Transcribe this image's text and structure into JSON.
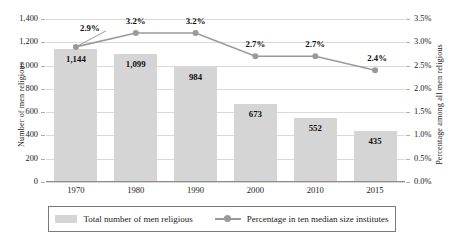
{
  "chart_data": {
    "type": "bar",
    "title": "",
    "subtitle": "",
    "categories": [
      "1970",
      "1980",
      "1990",
      "2000",
      "2010",
      "2015"
    ],
    "series": [
      {
        "name": "Total number of men religious",
        "type": "bar",
        "axis": "left",
        "values": [
          1144,
          1099,
          984,
          673,
          552,
          435
        ],
        "labels": [
          "1,144",
          "1,099",
          "984",
          "673",
          "552",
          "435"
        ],
        "color": "#d5d5d5"
      },
      {
        "name": "Percentage in ten median size institutes",
        "type": "line",
        "axis": "right",
        "values": [
          2.9,
          3.2,
          3.2,
          2.7,
          2.7,
          2.4
        ],
        "labels": [
          "2.9%",
          "3.2%",
          "3.2%",
          "2.7%",
          "2.7%",
          "2.4%"
        ],
        "color": "#9a9a9a"
      }
    ],
    "xlabel": "",
    "ylabel": "Number of men religious",
    "y2label": "Percentage among all men religious",
    "ylim": [
      0,
      1400
    ],
    "y2lim": [
      0,
      3.5
    ],
    "yticks": [
      "0",
      "200",
      "400",
      "600",
      "800",
      "1,000",
      "1,200",
      "1,400"
    ],
    "y2ticks": [
      "0.0%",
      "0.5%",
      "1.0%",
      "1.5%",
      "2.0%",
      "2.5%",
      "3.0%",
      "3.5%"
    ],
    "grid": true,
    "legend_position": "bottom"
  },
  "axes": {
    "left_title": "Number of men religious",
    "right_title": "Percentage among all men religious"
  },
  "legend": {
    "bar_label": "Total number of men religious",
    "line_label": "Percentage in ten median size institutes"
  }
}
